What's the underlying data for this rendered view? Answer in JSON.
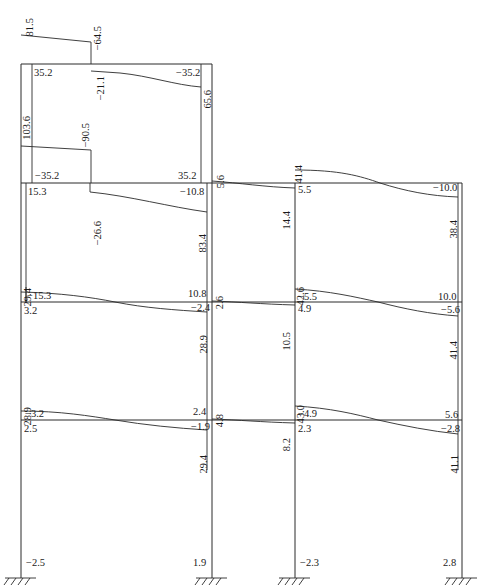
{
  "diagram": {
    "title": "",
    "units": "",
    "frame": {
      "columns_x": [
        21,
        212,
        295,
        462
      ],
      "levels_y": {
        "top_roof": 64,
        "roof": 183,
        "floor2": 302,
        "floor1": 420,
        "ground": 578
      }
    },
    "labels": [
      {
        "id": "l1",
        "text": "81.5",
        "x": 33,
        "y": 18,
        "rot": -90
      },
      {
        "id": "l2",
        "text": "−64.5",
        "x": 101,
        "y": 26,
        "rot": -90
      },
      {
        "id": "l3",
        "text": "35.2",
        "x": 34,
        "y": 76,
        "rot": 0
      },
      {
        "id": "l4",
        "text": "−35.2",
        "x": 176,
        "y": 76,
        "rot": 0
      },
      {
        "id": "l5",
        "text": "−21.1",
        "x": 104,
        "y": 76,
        "rot": -90
      },
      {
        "id": "l6",
        "text": "65.6",
        "x": 211,
        "y": 90,
        "rot": -90
      },
      {
        "id": "l7",
        "text": "103.6",
        "x": 30,
        "y": 116,
        "rot": -90
      },
      {
        "id": "l8",
        "text": "−90.5",
        "x": 89,
        "y": 123,
        "rot": -90
      },
      {
        "id": "l9",
        "text": "−35.2",
        "x": 35,
        "y": 179,
        "rot": 0
      },
      {
        "id": "l10",
        "text": "35.2",
        "x": 178,
        "y": 179,
        "rot": 0
      },
      {
        "id": "l11",
        "text": "5.6",
        "x": 224,
        "y": 175,
        "rot": -90
      },
      {
        "id": "l12",
        "text": "41.4",
        "x": 302,
        "y": 165,
        "rot": -90
      },
      {
        "id": "l13",
        "text": "15.3",
        "x": 28,
        "y": 195,
        "rot": 0
      },
      {
        "id": "l14",
        "text": "−10.8",
        "x": 180,
        "y": 195,
        "rot": 0
      },
      {
        "id": "l15",
        "text": "−26.6",
        "x": 101,
        "y": 221,
        "rot": -90
      },
      {
        "id": "l16",
        "text": "83.4",
        "x": 206,
        "y": 234,
        "rot": -90
      },
      {
        "id": "l17",
        "text": "5.5",
        "x": 298,
        "y": 193,
        "rot": 0
      },
      {
        "id": "l18",
        "text": "14.4",
        "x": 290,
        "y": 211,
        "rot": -90
      },
      {
        "id": "l19",
        "text": "−10.0",
        "x": 433,
        "y": 191,
        "rot": 0
      },
      {
        "id": "l20",
        "text": "38.4",
        "x": 457,
        "y": 220,
        "rot": -90
      },
      {
        "id": "l21",
        "text": "29.4",
        "x": 31,
        "y": 288,
        "rot": -90
      },
      {
        "id": "l22",
        "text": "−15.3",
        "x": 27,
        "y": 299,
        "rot": 0
      },
      {
        "id": "l23",
        "text": "10.8",
        "x": 188,
        "y": 297,
        "rot": 0
      },
      {
        "id": "l24",
        "text": "2.6",
        "x": 223,
        "y": 296,
        "rot": -90
      },
      {
        "id": "l25",
        "text": "42.6",
        "x": 304,
        "y": 287,
        "rot": -90
      },
      {
        "id": "l26",
        "text": "−5.5",
        "x": 298,
        "y": 300,
        "rot": 0
      },
      {
        "id": "l27",
        "text": "10.0",
        "x": 438,
        "y": 300,
        "rot": 0
      },
      {
        "id": "l28",
        "text": "3.2",
        "x": 24,
        "y": 314,
        "rot": 0
      },
      {
        "id": "l29",
        "text": "−2.4",
        "x": 191,
        "y": 311,
        "rot": 0
      },
      {
        "id": "l30",
        "text": "28.9",
        "x": 207,
        "y": 335,
        "rot": -90
      },
      {
        "id": "l31",
        "text": "10.5",
        "x": 290,
        "y": 332,
        "rot": -90
      },
      {
        "id": "l32",
        "text": "4.9",
        "x": 298,
        "y": 312,
        "rot": 0
      },
      {
        "id": "l33",
        "text": "−5.6",
        "x": 441,
        "y": 313,
        "rot": 0
      },
      {
        "id": "l34",
        "text": "41.4",
        "x": 457,
        "y": 341,
        "rot": -90
      },
      {
        "id": "l35",
        "text": "28.9",
        "x": 31,
        "y": 407,
        "rot": -90
      },
      {
        "id": "l36",
        "text": "−3.2",
        "x": 25,
        "y": 417,
        "rot": 0
      },
      {
        "id": "l37",
        "text": "2.4",
        "x": 193,
        "y": 415,
        "rot": 0
      },
      {
        "id": "l38",
        "text": "4.8",
        "x": 223,
        "y": 414,
        "rot": -90
      },
      {
        "id": "l39",
        "text": "43.0",
        "x": 304,
        "y": 405,
        "rot": -90
      },
      {
        "id": "l40",
        "text": "−4.9",
        "x": 298,
        "y": 417,
        "rot": 0
      },
      {
        "id": "l41",
        "text": "5.6",
        "x": 445,
        "y": 418,
        "rot": 0
      },
      {
        "id": "l42",
        "text": "2.5",
        "x": 24,
        "y": 432,
        "rot": 0
      },
      {
        "id": "l43",
        "text": "−1.9",
        "x": 191,
        "y": 430,
        "rot": 0
      },
      {
        "id": "l44",
        "text": "29.4",
        "x": 207,
        "y": 455,
        "rot": -90
      },
      {
        "id": "l45",
        "text": "8.2",
        "x": 290,
        "y": 438,
        "rot": -90
      },
      {
        "id": "l46",
        "text": "2.3",
        "x": 298,
        "y": 432,
        "rot": 0
      },
      {
        "id": "l47",
        "text": "−2.8",
        "x": 441,
        "y": 432,
        "rot": 0
      },
      {
        "id": "l48",
        "text": "41.1",
        "x": 458,
        "y": 455,
        "rot": -90
      },
      {
        "id": "l49",
        "text": "−2.5",
        "x": 26,
        "y": 566,
        "rot": 0
      },
      {
        "id": "l50",
        "text": "1.9",
        "x": 193,
        "y": 566,
        "rot": 0
      },
      {
        "id": "l51",
        "text": "−2.3",
        "x": 300,
        "y": 566,
        "rot": 0
      },
      {
        "id": "l52",
        "text": "2.8",
        "x": 443,
        "y": 566,
        "rot": 0
      }
    ]
  }
}
